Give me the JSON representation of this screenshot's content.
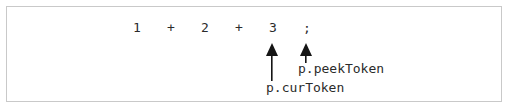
{
  "diagram": {
    "type": "token-pointer-annotation",
    "border_color": "#c9c9c9",
    "background_color": "#ffffff",
    "text_color": "#2b2b2b",
    "expression_tokens": [
      {
        "text": "1",
        "x": 130
      },
      {
        "text": "+",
        "x": 164
      },
      {
        "text": "2",
        "x": 198
      },
      {
        "text": "+",
        "x": 232
      },
      {
        "text": "3",
        "x": 266
      },
      {
        "text": ";",
        "x": 300
      }
    ],
    "expression_string": "1 + 2 + 3 ;",
    "pointers": [
      {
        "label": "p.curToken",
        "target_token": "3",
        "arrow_x": 266,
        "arrow_top": 42,
        "arrow_bottom": 78,
        "arrow_length": 36,
        "label_x": 265,
        "label_y": 80
      },
      {
        "label": "p.peekToken",
        "target_token": ";",
        "arrow_x": 300,
        "arrow_top": 42,
        "arrow_bottom": 59,
        "arrow_length": 17,
        "label_x": 297,
        "label_y": 61
      }
    ]
  }
}
